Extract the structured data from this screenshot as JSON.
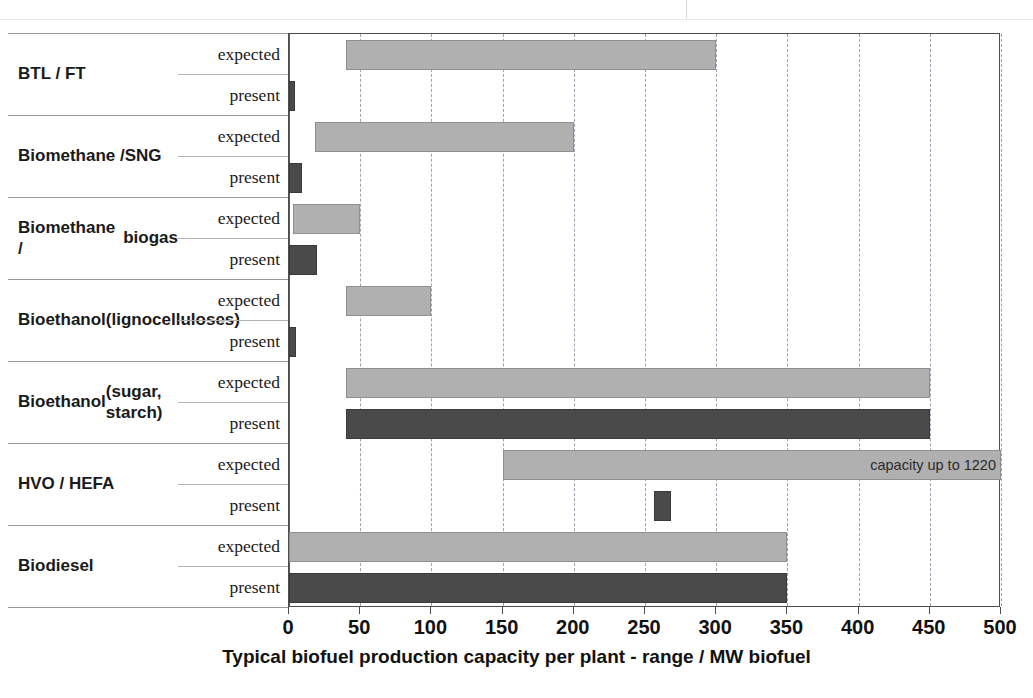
{
  "chart_data": {
    "type": "bar",
    "orientation": "horizontal",
    "title": "",
    "xlabel": "Typical biofuel production capacity per plant - range / MW biofuel",
    "ylabel": "",
    "xlim": [
      0,
      500
    ],
    "xticks": [
      0,
      50,
      100,
      150,
      200,
      250,
      300,
      350,
      400,
      450,
      500
    ],
    "grid": "vertical dashed at every 50",
    "legend": "none (row labels: expected / present)",
    "series": [
      {
        "name": "expected",
        "color": "#b0b0b0"
      },
      {
        "name": "present",
        "color": "#4a4a4a"
      }
    ],
    "categories": [
      "BTL / FT",
      "Biomethane / SNG",
      "Biomethane / biogas",
      "Bioethanol (lignocelluloses)",
      "Bioethanol (sugar, starch)",
      "HVO / HEFA",
      "Biodiesel"
    ],
    "bars": [
      {
        "category": "BTL / FT",
        "series": "expected",
        "start": 40,
        "end": 300,
        "note": ""
      },
      {
        "category": "BTL / FT",
        "series": "present",
        "start": 0,
        "end": 4,
        "note": ""
      },
      {
        "category": "Biomethane / SNG",
        "series": "expected",
        "start": 18,
        "end": 200,
        "note": ""
      },
      {
        "category": "Biomethane / SNG",
        "series": "present",
        "start": 0,
        "end": 9,
        "note": ""
      },
      {
        "category": "Biomethane / biogas",
        "series": "expected",
        "start": 3,
        "end": 50,
        "note": ""
      },
      {
        "category": "Biomethane / biogas",
        "series": "present",
        "start": 0,
        "end": 20,
        "note": ""
      },
      {
        "category": "Bioethanol (lignocelluloses)",
        "series": "expected",
        "start": 40,
        "end": 100,
        "note": ""
      },
      {
        "category": "Bioethanol (lignocelluloses)",
        "series": "present",
        "start": 0,
        "end": 5,
        "note": ""
      },
      {
        "category": "Bioethanol (sugar, starch)",
        "series": "expected",
        "start": 40,
        "end": 450,
        "note": ""
      },
      {
        "category": "Bioethanol (sugar, starch)",
        "series": "present",
        "start": 40,
        "end": 450,
        "note": ""
      },
      {
        "category": "HVO / HEFA",
        "series": "expected",
        "start": 150,
        "end": 500,
        "note": "capacity up to 1220"
      },
      {
        "category": "HVO / HEFA",
        "series": "present",
        "start": 256,
        "end": 268,
        "note": ""
      },
      {
        "category": "Biodiesel",
        "series": "expected",
        "start": 0,
        "end": 350,
        "note": ""
      },
      {
        "category": "Biodiesel",
        "series": "present",
        "start": 0,
        "end": 350,
        "note": ""
      }
    ]
  },
  "axis": {
    "tick_labels": [
      "0",
      "50",
      "100",
      "150",
      "200",
      "250",
      "300",
      "350",
      "400",
      "450",
      "500"
    ],
    "title": "Typical biofuel production capacity per plant - range / MW biofuel"
  },
  "rows": [
    {
      "name_lines": [
        "BTL / FT"
      ],
      "expected_label": "expected",
      "present_label": "present"
    },
    {
      "name_lines": [
        "Biomethane /",
        "SNG"
      ],
      "expected_label": "expected",
      "present_label": "present"
    },
    {
      "name_lines": [
        "Biomethane /",
        "biogas"
      ],
      "expected_label": "expected",
      "present_label": "present"
    },
    {
      "name_lines": [
        "Bioethanol",
        "(lignocelluloses)"
      ],
      "expected_label": "expected",
      "present_label": "present"
    },
    {
      "name_lines": [
        "Bioethanol",
        "(sugar, starch)"
      ],
      "expected_label": "expected",
      "present_label": "present"
    },
    {
      "name_lines": [
        "HVO / HEFA"
      ],
      "expected_label": "expected",
      "present_label": "present"
    },
    {
      "name_lines": [
        "Biodiesel"
      ],
      "expected_label": "expected",
      "present_label": "present"
    }
  ],
  "annotations": [
    {
      "text": "capacity up to 1220",
      "attached_to": "HVO / HEFA expected"
    }
  ],
  "colors": {
    "expected_fill": "#b0b0b0",
    "present_fill": "#4a4a4a",
    "grid": "#9aa3b0",
    "axis": "#4d4d4d"
  }
}
